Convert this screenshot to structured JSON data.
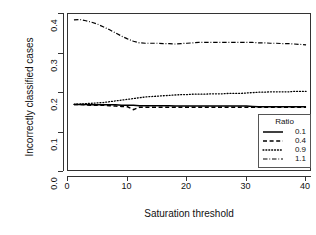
{
  "chart_data": {
    "type": "line",
    "title": "",
    "xlabel": "Saturation threshold",
    "ylabel": "Incorrectly classified cases",
    "xlim": [
      0,
      41
    ],
    "ylim": [
      0.0,
      0.4
    ],
    "xticks": [
      "0",
      "10",
      "20",
      "30",
      "40"
    ],
    "xtick_values": [
      0,
      10,
      20,
      30,
      40
    ],
    "yticks": [
      "0.0",
      "0.1",
      "0.2",
      "0.3",
      "0.4"
    ],
    "ytick_values": [
      0.0,
      0.1,
      0.2,
      0.3,
      0.4
    ],
    "grid": false,
    "legend_position": "bottom-right",
    "legend_title": "Ratio",
    "x": [
      1,
      2,
      3,
      4,
      5,
      6,
      7,
      8,
      9,
      10,
      11,
      12,
      13,
      14,
      15,
      16,
      17,
      18,
      19,
      20,
      21,
      22,
      23,
      24,
      25,
      26,
      27,
      28,
      29,
      30,
      31,
      32,
      33,
      34,
      35,
      36,
      37,
      38,
      39,
      40
    ],
    "series": [
      {
        "name": "0.1",
        "linestyle": "solid",
        "color": "#000000",
        "values": [
          0.171,
          0.171,
          0.171,
          0.17,
          0.17,
          0.17,
          0.17,
          0.17,
          0.169,
          0.169,
          0.169,
          0.168,
          0.168,
          0.168,
          0.168,
          0.168,
          0.168,
          0.167,
          0.167,
          0.167,
          0.167,
          0.167,
          0.167,
          0.167,
          0.167,
          0.167,
          0.167,
          0.167,
          0.167,
          0.167,
          0.166,
          0.165,
          0.165,
          0.165,
          0.165,
          0.165,
          0.165,
          0.165,
          0.165,
          0.165
        ]
      },
      {
        "name": "0.4",
        "linestyle": "dashed",
        "color": "#000000",
        "values": [
          0.171,
          0.171,
          0.17,
          0.169,
          0.169,
          0.169,
          0.168,
          0.167,
          0.166,
          0.165,
          0.158,
          0.164,
          0.164,
          0.164,
          0.164,
          0.164,
          0.164,
          0.164,
          0.164,
          0.164,
          0.164,
          0.164,
          0.164,
          0.164,
          0.164,
          0.164,
          0.164,
          0.164,
          0.164,
          0.164,
          0.164,
          0.164,
          0.164,
          0.164,
          0.164,
          0.164,
          0.164,
          0.164,
          0.164,
          0.164
        ]
      },
      {
        "name": "0.9",
        "linestyle": "dotted",
        "color": "#000000",
        "values": [
          0.171,
          0.172,
          0.173,
          0.174,
          0.175,
          0.176,
          0.178,
          0.18,
          0.182,
          0.184,
          0.186,
          0.188,
          0.19,
          0.191,
          0.192,
          0.193,
          0.194,
          0.195,
          0.196,
          0.196,
          0.197,
          0.197,
          0.197,
          0.198,
          0.198,
          0.198,
          0.199,
          0.199,
          0.199,
          0.2,
          0.201,
          0.202,
          0.202,
          0.203,
          0.203,
          0.203,
          0.203,
          0.204,
          0.204,
          0.204
        ]
      },
      {
        "name": "1.1",
        "linestyle": "dashdot",
        "color": "#000000",
        "values": [
          0.385,
          0.386,
          0.383,
          0.379,
          0.374,
          0.367,
          0.36,
          0.352,
          0.344,
          0.337,
          0.331,
          0.327,
          0.326,
          0.326,
          0.326,
          0.325,
          0.325,
          0.324,
          0.325,
          0.326,
          0.327,
          0.328,
          0.328,
          0.328,
          0.328,
          0.328,
          0.328,
          0.328,
          0.328,
          0.328,
          0.328,
          0.327,
          0.327,
          0.326,
          0.326,
          0.325,
          0.325,
          0.324,
          0.323,
          0.322
        ]
      }
    ]
  }
}
